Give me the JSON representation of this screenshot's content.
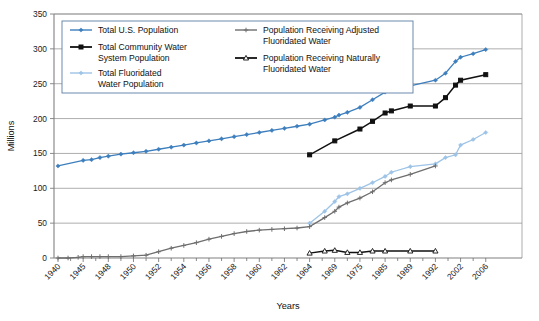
{
  "chart_data": {
    "type": "line",
    "title": "",
    "xlabel": "Years",
    "ylabel": "Millions",
    "ylim": [
      0,
      350
    ],
    "yticks": [
      0,
      50,
      100,
      150,
      200,
      250,
      300,
      350
    ],
    "grid": true,
    "legend_position": "top-left-inside",
    "categories": [
      1940,
      1941,
      1942,
      1943,
      1944,
      1945,
      1946,
      1947,
      1948,
      1949,
      1950,
      1951,
      1952,
      1953,
      1954,
      1955,
      1956,
      1957,
      1958,
      1959,
      1960,
      1961,
      1962,
      1963,
      1964,
      1967,
      1969,
      1970,
      1972,
      1975,
      1980,
      1985,
      1986,
      1989,
      1992,
      1996,
      2000,
      2002,
      2004,
      2006
    ],
    "xtick_labels": [
      "1940",
      "1945",
      "1948",
      "1950",
      "1952",
      "1954",
      "1956",
      "1958",
      "1960",
      "1962",
      "1964",
      "1969",
      "1975",
      "1985",
      "1989",
      "1992",
      "2002",
      "2006"
    ],
    "series": [
      {
        "name": "Total U.S. Population",
        "color": "#3d7ebd",
        "marker": "diamond",
        "x": [
          1940,
          1945,
          1946,
          1947,
          1948,
          1949,
          1950,
          1951,
          1952,
          1953,
          1954,
          1955,
          1956,
          1957,
          1958,
          1959,
          1960,
          1961,
          1962,
          1963,
          1964,
          1967,
          1969,
          1970,
          1972,
          1975,
          1980,
          1985,
          1986,
          1989,
          1992,
          1996,
          2000,
          2002,
          2004,
          2006
        ],
        "values": [
          132,
          140,
          141,
          144,
          146,
          149,
          151,
          153,
          156,
          159,
          162,
          165,
          168,
          171,
          174,
          177,
          180,
          183,
          186,
          189,
          192,
          198,
          202,
          205,
          209,
          216,
          227,
          238,
          240,
          247,
          255,
          265,
          282,
          288,
          293,
          299
        ]
      },
      {
        "name": "Total Community Water System Population",
        "color": "#111111",
        "marker": "square",
        "x": [
          1964,
          1969,
          1975,
          1980,
          1985,
          1986,
          1989,
          1992,
          1996,
          2000,
          2002,
          2006
        ],
        "values": [
          148,
          168,
          185,
          196,
          208,
          211,
          218,
          218,
          230,
          248,
          255,
          263
        ]
      },
      {
        "name": "Total Fluoridated Water Population",
        "color": "#9dc3e6",
        "marker": "diamond",
        "x": [
          1964,
          1967,
          1969,
          1970,
          1972,
          1975,
          1980,
          1985,
          1986,
          1989,
          1992,
          1996,
          2000,
          2002,
          2004,
          2006
        ],
        "values": [
          50,
          67,
          81,
          88,
          92,
          100,
          108,
          117,
          123,
          131,
          135,
          144,
          148,
          162,
          170,
          180
        ]
      },
      {
        "name": "Population Receiving Adjusted Fluoridated Water",
        "color": "#6e6e6e",
        "marker": "plus",
        "x": [
          1940,
          1942,
          1944,
          1945,
          1946,
          1947,
          1948,
          1949,
          1950,
          1951,
          1952,
          1953,
          1954,
          1955,
          1956,
          1957,
          1958,
          1959,
          1960,
          1961,
          1962,
          1963,
          1964,
          1967,
          1969,
          1970,
          1972,
          1975,
          1980,
          1985,
          1986,
          1989,
          1992
        ],
        "values": [
          0,
          0,
          1,
          2,
          2,
          2,
          2,
          2,
          3,
          4,
          9,
          14,
          18,
          22,
          27,
          31,
          35,
          38,
          40,
          41,
          42,
          43,
          45,
          58,
          67,
          73,
          79,
          86,
          95,
          108,
          112,
          120,
          132
        ]
      },
      {
        "name": "Population Receiving Naturally Fluoridated Water",
        "color": "#111111",
        "marker": "open-triangle",
        "x": [
          1964,
          1967,
          1969,
          1972,
          1975,
          1980,
          1985,
          1989,
          1992
        ],
        "values": [
          7,
          10,
          11,
          8,
          8,
          10,
          10,
          10,
          10
        ]
      }
    ]
  },
  "legend": {
    "entries": [
      {
        "label_line1": "Total U.S. Population",
        "label_line2": ""
      },
      {
        "label_line1": "Total Community Water",
        "label_line2": "System Population"
      },
      {
        "label_line1": "Total Fluoridated",
        "label_line2": "Water Population"
      },
      {
        "label_line1": "Population Receiving Adjusted",
        "label_line2": "Fluoridated Water"
      },
      {
        "label_line1": "Population Receiving Naturally",
        "label_line2": "Fluoridated Water"
      }
    ]
  },
  "axes": {
    "y_title": "Millions",
    "x_title": "Years"
  }
}
